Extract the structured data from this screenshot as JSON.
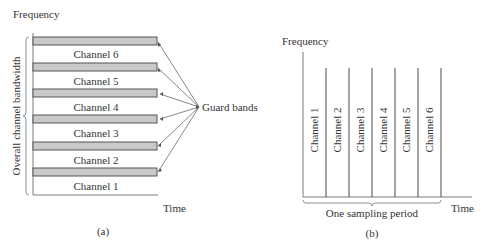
{
  "panel_a": {
    "y_axis_label": "Frequency",
    "x_axis_label": "Time",
    "side_label": "Overall channel bandwidth",
    "callout_label": "Guard bands",
    "caption": "(a)",
    "channels": [
      "Channel 6",
      "Channel 5",
      "Channel 4",
      "Channel 3",
      "Channel 2",
      "Channel 1"
    ],
    "guard_band_count": 6
  },
  "panel_b": {
    "y_axis_label": "Frequency",
    "x_axis_label": "Time",
    "brace_label": "One sampling period",
    "caption": "(b)",
    "channels": [
      "Channel 1",
      "Channel 2",
      "Channel 3",
      "Channel 4",
      "Channel 5",
      "Channel 6"
    ]
  },
  "colors": {
    "guard_band_fill": "#c9c9c9",
    "line": "#4a4a4a",
    "text": "#333333"
  }
}
